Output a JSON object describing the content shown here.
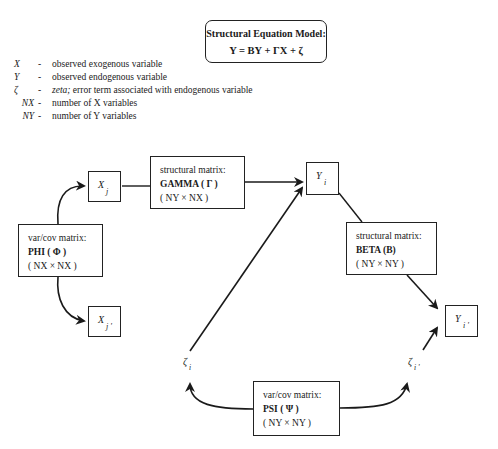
{
  "title_box": {
    "heading": "Structural Equation Model:",
    "equation": "Y = BY + ΓX + ζ"
  },
  "legend": [
    {
      "symbol": "X",
      "dash": "-",
      "text": "observed exogenous variable"
    },
    {
      "symbol": "Y",
      "dash": "-",
      "text": "observed endogenous variable"
    },
    {
      "symbol": "ζ",
      "dash": "-",
      "emph": "zeta;",
      "text": " error term associated with endogenous variable"
    },
    {
      "symbol": "NX",
      "dash": "-",
      "text": "number of  X  variables"
    },
    {
      "symbol": "NY",
      "dash": "-",
      "text": "number of  Y  variables"
    }
  ],
  "nodes": {
    "x_j": {
      "var": "X",
      "sub": "j"
    },
    "x_j_prime": {
      "var": "X",
      "sub": "j '"
    },
    "y_i": {
      "var": "Y",
      "sub": "i"
    },
    "y_i_prime": {
      "var": "Y",
      "sub": "i '"
    },
    "zeta_i": {
      "var": "ζ",
      "sub": "i"
    },
    "zeta_i_prime": {
      "var": "ζ",
      "sub": "i '"
    }
  },
  "matrices": {
    "gamma": {
      "kind": "structural matrix:",
      "name": "GAMMA ( Γ )",
      "dims": "( NY × NX )"
    },
    "phi": {
      "kind": "var/cov matrix:",
      "name": "PHI ( Φ )",
      "dims": "( NX × NX )"
    },
    "beta": {
      "kind": "structural matrix:",
      "name": "BETA (B)",
      "dims": "( NY × NY )"
    },
    "psi": {
      "kind": "var/cov matrix:",
      "name": "PSI ( Ψ )",
      "dims": "( NY × NY )"
    }
  },
  "colors": {
    "stroke": "#1a1a1a",
    "background": "#ffffff"
  }
}
